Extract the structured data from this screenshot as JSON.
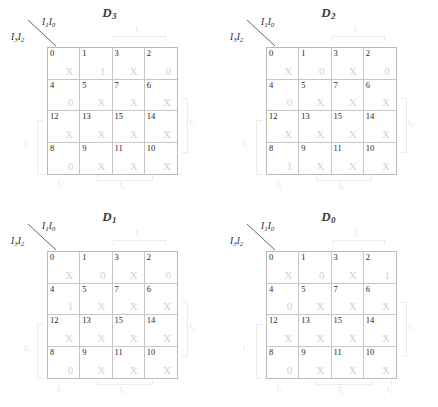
{
  "axis": {
    "top_label": "I",
    "top_sub_a": "1",
    "top_sub_b": "0",
    "bottom_label": "I",
    "bottom_sub_a": "3",
    "bottom_sub_b": "2",
    "top_text": "I₁I₀",
    "bottom_text": "I₃I₂"
  },
  "group_labels": {
    "top": "I₁",
    "right": "I₃",
    "left": "I₃",
    "bottom": "I₀",
    "stray": "I₀",
    "bottom_right": "I₁"
  },
  "cell_indices": [
    "0",
    "1",
    "3",
    "2",
    "4",
    "5",
    "7",
    "6",
    "12",
    "13",
    "15",
    "14",
    "8",
    "9",
    "11",
    "10"
  ],
  "maps": [
    {
      "id": "D3",
      "title": "D",
      "subscript": "3",
      "values": [
        "X",
        "1",
        "X",
        "0",
        "0",
        "X",
        "X",
        "X",
        "X",
        "X",
        "X",
        "X",
        "0",
        "X",
        "X",
        "X"
      ],
      "has_bottom_right_label": false
    },
    {
      "id": "D2",
      "title": "D",
      "subscript": "2",
      "values": [
        "X",
        "0",
        "X",
        "0",
        "0",
        "X",
        "X",
        "X",
        "X",
        "X",
        "X",
        "X",
        "1",
        "X",
        "X",
        "X"
      ],
      "has_bottom_right_label": false
    },
    {
      "id": "D1",
      "title": "D",
      "subscript": "1",
      "values": [
        "X",
        "0",
        "X",
        "0",
        "1",
        "X",
        "X",
        "X",
        "X",
        "X",
        "X",
        "X",
        "0",
        "X",
        "X",
        "X"
      ],
      "has_bottom_right_label": false
    },
    {
      "id": "D0",
      "title": "D",
      "subscript": "0",
      "values": [
        "X",
        "0",
        "X",
        "1",
        "0",
        "X",
        "X",
        "X",
        "X",
        "X",
        "X",
        "X",
        "0",
        "X",
        "X",
        "X"
      ],
      "has_bottom_right_label": true
    }
  ]
}
